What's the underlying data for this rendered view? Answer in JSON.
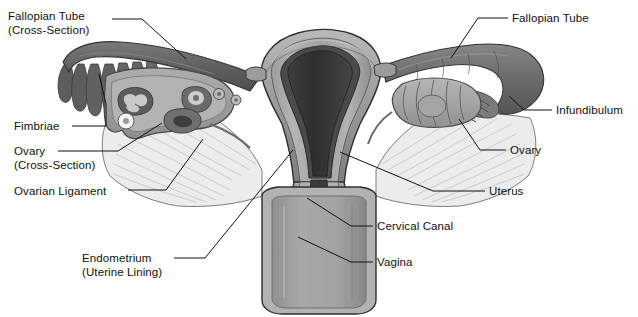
{
  "figure": {
    "background_color": "#ffffff",
    "line_color": "#111111",
    "palette": {
      "tube_dark": "#6d6d6d",
      "tube_darker": "#5a5a5a",
      "ovary_mid": "#9a9a9a",
      "ovary_light": "#b8b8b8",
      "uterus_wall": "#a0a0a0",
      "uterus_outer": "#8c8c8c",
      "endometrium_dark": "#4a4a4a",
      "cavity_black": "#2b2b2b",
      "ligament_light": "#ececec",
      "vagina_fill": "#9c9c9c",
      "vagina_wall": "#b5b5b5",
      "outline": "#3a3a3a"
    }
  },
  "labels": [
    {
      "id": "fallopian-tube-cross-section",
      "line1": "Fallopian Tube",
      "line2": "(Cross-Section)",
      "side": "left",
      "x": 8,
      "y": 10,
      "leader": "M 112,19 L 142,19 L 186,59"
    },
    {
      "id": "fimbriae",
      "line1": "Fimbriae",
      "line2": "",
      "side": "left",
      "x": 14,
      "y": 120,
      "leader": "M 72,126 L 106,126 L 106,104 L 99,74"
    },
    {
      "id": "ovary-cross-section",
      "line1": "Ovary",
      "line2": "(Cross-Section)",
      "side": "left",
      "x": 14,
      "y": 145,
      "leader": "M 58,151 L 118,151 L 162,123"
    },
    {
      "id": "ovarian-ligament",
      "line1": "Ovarian Ligament",
      "line2": "",
      "side": "left",
      "x": 14,
      "y": 185,
      "leader": "M 128,190 L 166,190 L 203,139"
    },
    {
      "id": "endometrium",
      "line1": "Endometrium",
      "line2": "(Uterine Lining)",
      "side": "left",
      "x": 82,
      "y": 252,
      "leader": "M 174,258 L 205,258 L 293,150"
    },
    {
      "id": "fallopian-tube",
      "line1": "Fallopian Tube",
      "line2": "",
      "side": "right",
      "x": 512,
      "y": 12,
      "leader": "M 508,18 L 478,18 L 451,58"
    },
    {
      "id": "infundibulum",
      "line1": "Infundibulum",
      "line2": "",
      "side": "right",
      "x": 556,
      "y": 104,
      "leader": "M 552,110 L 524,110 L 509,96"
    },
    {
      "id": "ovary",
      "line1": "Ovary",
      "line2": "",
      "side": "right",
      "x": 510,
      "y": 144,
      "leader": "M 506,150 L 480,150 L 459,119"
    },
    {
      "id": "uterus",
      "line1": "Uterus",
      "line2": "",
      "side": "right",
      "x": 489,
      "y": 185,
      "leader": "M 485,191 L 433,191 L 340,152"
    },
    {
      "id": "cervical-canal",
      "line1": "Cervical Canal",
      "line2": "",
      "side": "right",
      "x": 377,
      "y": 220,
      "leader": "M 373,226 L 351,226 L 307,198"
    },
    {
      "id": "vagina",
      "line1": "Vagina",
      "line2": "",
      "side": "right",
      "x": 377,
      "y": 256,
      "leader": "M 373,262 L 351,262 L 298,237"
    }
  ]
}
